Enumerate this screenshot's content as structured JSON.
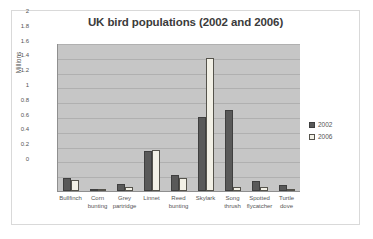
{
  "chart_data": {
    "type": "bar",
    "title": "UK bird populations (2002 and 2006)",
    "xlabel": "",
    "ylabel": "Millions",
    "ylim": [
      0,
      2
    ],
    "ytick_labels": [
      "2",
      "1.8",
      "1.6",
      "1.4",
      "1.2",
      "1",
      "0.8",
      "0.6",
      "0.4",
      "0.2",
      "0"
    ],
    "ytick_values": [
      2,
      1.8,
      1.6,
      1.4,
      1.2,
      1,
      0.8,
      0.6,
      0.4,
      0.2,
      0
    ],
    "grid": true,
    "legend_position": "right",
    "categories": [
      "Bullfinch",
      "Corn bunting",
      "Grey partridge",
      "Linnet",
      "Reed bunting",
      "Skylark",
      "Song thrush",
      "Spotted flycatcher",
      "Turtle dove"
    ],
    "series": [
      {
        "name": "2002",
        "color": "#595959",
        "values": [
          0.17,
          0.02,
          0.09,
          0.54,
          0.22,
          1.0,
          1.1,
          0.14,
          0.08
        ]
      },
      {
        "name": "2006",
        "color": "#f2f0e6",
        "values": [
          0.15,
          0.01,
          0.05,
          0.56,
          0.18,
          1.8,
          0.05,
          0.06,
          0.03
        ]
      }
    ]
  },
  "legend": {
    "items": [
      {
        "label": "2002"
      },
      {
        "label": "2006"
      }
    ]
  }
}
